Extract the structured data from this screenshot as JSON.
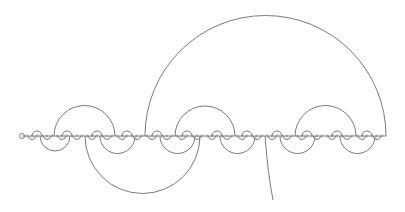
{
  "diagram": {
    "type": "arc-diagram",
    "stroke_color": "#7a7a7a",
    "background": "#ffffff",
    "axis": {
      "y": 136,
      "x_start": 22,
      "x_end": 386,
      "tick_spacing": 5
    },
    "start_marker": {
      "cx": 22,
      "cy": 136,
      "r": 2.5
    },
    "large_arcs_above": [
      {
        "x1": 145,
        "x2": 386
      }
    ],
    "medium_arcs_above": [
      {
        "x1": 54,
        "x2": 115
      },
      {
        "x1": 175,
        "x2": 235
      },
      {
        "x1": 295,
        "x2": 356
      }
    ],
    "large_arcs_below": [
      {
        "x1": 85,
        "x2": 200
      }
    ],
    "medium_arcs_below": [
      {
        "x1": 40,
        "x2": 70
      },
      {
        "x1": 100,
        "x2": 135
      },
      {
        "x1": 160,
        "x2": 195
      },
      {
        "x1": 220,
        "x2": 255
      },
      {
        "x1": 280,
        "x2": 315
      },
      {
        "x1": 340,
        "x2": 375
      }
    ],
    "small_arc_radius": 5,
    "small_arcs_above_start": 37,
    "small_arcs_above_step": 30,
    "small_arcs_above_count": 12,
    "small_arcs_below_start": 32,
    "small_arcs_below_step": 15,
    "small_arcs_below_count": 24,
    "tail": {
      "x1": 265,
      "y1": 136,
      "cx": 268,
      "cy": 175,
      "x2": 273,
      "y2": 200
    }
  }
}
